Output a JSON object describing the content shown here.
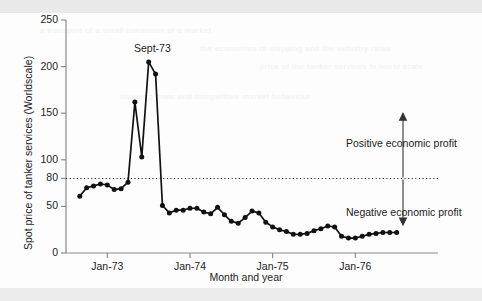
{
  "chart_data": {
    "type": "line",
    "title": "",
    "xlabel": "Month and year",
    "ylabel": "Spot price of tanker services (Worldscale)",
    "ylim": [
      0,
      250
    ],
    "yticks": [
      0,
      50,
      80,
      100,
      150,
      200,
      250
    ],
    "ytick_labels": [
      "0",
      "50",
      "80",
      "100",
      "150",
      "200",
      "250"
    ],
    "xtick_labels": [
      "Jan-73",
      "Jan-74",
      "Jan-75",
      "Jan-76"
    ],
    "xtick_values": [
      12,
      24,
      36,
      48
    ],
    "xlim": [
      6,
      60
    ],
    "grid": false,
    "legend": null,
    "reference_line": {
      "value": 80,
      "style": "dotted",
      "label_above": "Positive economic profit",
      "label_below": "Negative economic profit"
    },
    "annotations": [
      {
        "text": "Sept-73",
        "x": 20,
        "y": 205
      },
      {
        "text": "Positive economic profit",
        "x": 52,
        "y": 122
      },
      {
        "text": "Negative economic profit",
        "x": 52,
        "y": 38
      }
    ],
    "series": [
      {
        "name": "Spot price of tanker services",
        "x": [
          8,
          9,
          10,
          11,
          12,
          13,
          14,
          15,
          16,
          17,
          18,
          19,
          20,
          21,
          22,
          23,
          24,
          25,
          26,
          27,
          28,
          29,
          30,
          31,
          32,
          33,
          34,
          35,
          36,
          37,
          38,
          39,
          40,
          41,
          42,
          43,
          44,
          45,
          46,
          47,
          48,
          49,
          50,
          51,
          52,
          53,
          54
        ],
        "values": [
          61,
          70,
          72,
          74,
          73,
          68,
          69,
          76,
          162,
          103,
          205,
          192,
          51,
          43,
          46,
          46,
          48,
          48,
          44,
          42,
          49,
          41,
          34,
          32,
          38,
          45,
          43,
          33,
          28,
          25,
          23,
          20,
          20,
          21,
          24,
          26,
          29,
          28,
          18,
          16,
          16,
          18,
          20,
          21,
          22,
          22,
          22
        ]
      }
    ]
  },
  "ghost_text": {
    "rows": [
      "a transport of a small consumer of a market",
      "the economics of shipping and the industry rates",
      "price of the tanker services in world scale",
      "shipping firms and competitive market behaviour"
    ]
  }
}
